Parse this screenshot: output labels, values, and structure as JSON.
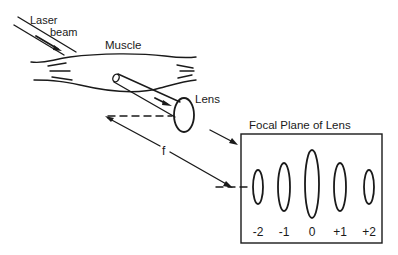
{
  "diagram": {
    "type": "optical-schematic",
    "labels": {
      "laser_line1": "Laser",
      "laser_line2": "beam",
      "muscle": "Muscle",
      "lens": "Lens",
      "focal_distance": "f",
      "focal_plane_title": "Focal Plane of Lens"
    },
    "diffraction_orders": [
      {
        "label": "-2",
        "x": 258,
        "ry": 17
      },
      {
        "label": "-1",
        "x": 284,
        "ry": 23
      },
      {
        "label": "0",
        "x": 312,
        "ry": 33
      },
      {
        "label": "+1",
        "x": 340,
        "ry": 23
      },
      {
        "label": "+2",
        "x": 369,
        "ry": 17
      }
    ],
    "colors": {
      "ink": "#1a1a1a",
      "background": "#ffffff"
    }
  }
}
